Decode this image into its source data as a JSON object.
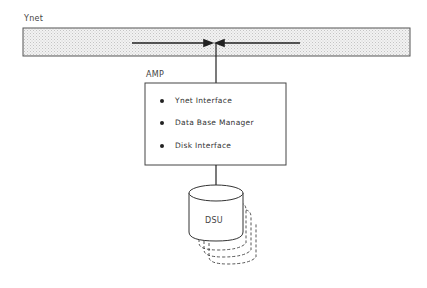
{
  "diagram": {
    "network": {
      "label": "Ynet"
    },
    "amp": {
      "label": "AMP",
      "components": [
        "Ynet Interface",
        "Data Base Manager",
        "Disk Interface"
      ]
    },
    "storage": {
      "label": "DSU",
      "stack_count": 4
    },
    "colors": {
      "bar_fill": "#e6e6e6",
      "line": "#333333"
    }
  }
}
